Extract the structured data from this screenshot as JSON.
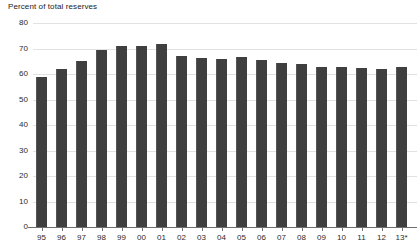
{
  "chart_data": {
    "type": "bar",
    "title": "Percent of total reserves",
    "xlabel": "",
    "ylabel": "",
    "ylim": [
      0,
      80
    ],
    "yticks": [
      0,
      10,
      20,
      30,
      40,
      50,
      60,
      70,
      80
    ],
    "grid": true,
    "legend": null,
    "bar_color": "#3f3f3f",
    "gridline_color": "#e2e2e2",
    "axis_color": "#6f6f6f",
    "categories": [
      "95",
      "96",
      "97",
      "98",
      "99",
      "00",
      "01",
      "02",
      "03",
      "04",
      "05",
      "06",
      "07",
      "08",
      "09",
      "10",
      "11",
      "12",
      "13*"
    ],
    "values": [
      59.0,
      62.0,
      65.2,
      69.4,
      71.0,
      71.0,
      71.7,
      67.2,
      66.4,
      66.0,
      66.5,
      65.4,
      64.2,
      64.1,
      62.6,
      62.8,
      62.5,
      62.0,
      62.8
    ],
    "annotations": [
      "13*"
    ]
  }
}
